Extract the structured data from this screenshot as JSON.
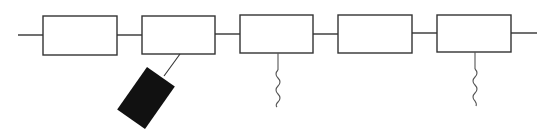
{
  "diagram": {
    "colors": {
      "background": "#ffffff",
      "stroke": "#333333",
      "block_fill": "#111111",
      "wave": "#555555"
    },
    "backbone": {
      "start_x": 18,
      "end_x": 537,
      "y_left": 35,
      "y_right": 33
    },
    "units": [
      {
        "index": 1,
        "x": 43,
        "y": 16,
        "w": 74,
        "h": 39,
        "label": ""
      },
      {
        "index": 2,
        "x": 142,
        "y": 16,
        "w": 73,
        "h": 38,
        "label": ""
      },
      {
        "index": 3,
        "x": 240,
        "y": 15,
        "w": 73,
        "h": 38,
        "label": ""
      },
      {
        "index": 4,
        "x": 338,
        "y": 15,
        "w": 74,
        "h": 38,
        "label": ""
      },
      {
        "index": 5,
        "x": 437,
        "y": 15,
        "w": 74,
        "h": 37,
        "label": ""
      }
    ],
    "attachments": [
      {
        "type": "tethered-block",
        "unit": 2,
        "anchor_x": 180,
        "anchor_y": 54,
        "fill": "#111111"
      },
      {
        "type": "wavy-chain",
        "unit": 3,
        "anchor_x": 278,
        "anchor_y": 53
      },
      {
        "type": "wavy-chain",
        "unit": 5,
        "anchor_x": 475,
        "anchor_y": 52
      }
    ]
  }
}
